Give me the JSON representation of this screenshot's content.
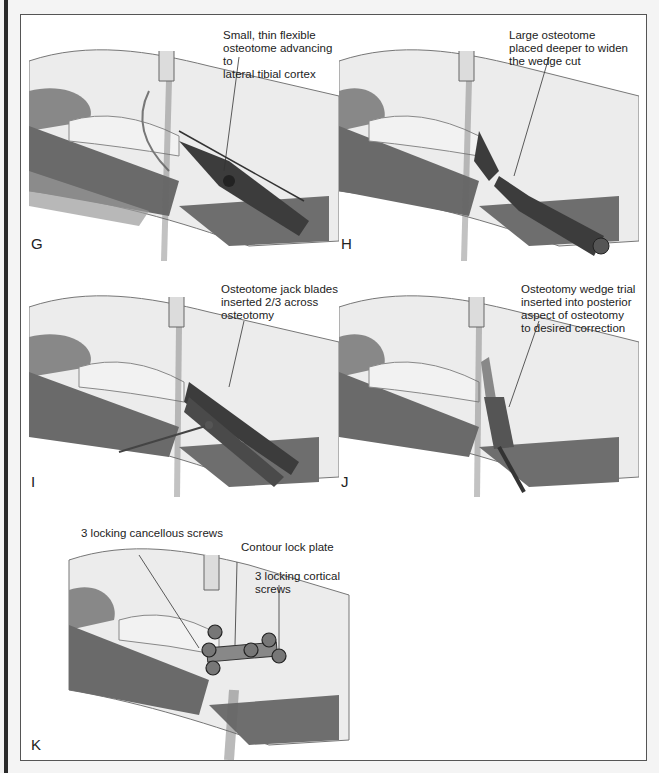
{
  "figure": {
    "panels": [
      {
        "id": "G",
        "letter": "G",
        "callouts": [
          "Small, thin flexible\nosteotome advancing to\nlateral tibial cortex"
        ]
      },
      {
        "id": "H",
        "letter": "H",
        "callouts": [
          "Large osteotome\nplaced deeper to widen\nthe wedge cut"
        ]
      },
      {
        "id": "I",
        "letter": "I",
        "callouts": [
          "Osteotome jack blades\ninserted 2/3 across\nosteotomy"
        ]
      },
      {
        "id": "J",
        "letter": "J",
        "callouts": [
          "Osteotomy wedge trial\ninserted into posterior\naspect of osteotomy\nto desired correction"
        ]
      },
      {
        "id": "K",
        "letter": "K",
        "callouts": [
          "3 locking cancellous screws",
          "Contour lock plate",
          "3 locking cortical screws"
        ]
      }
    ],
    "colors": {
      "muscle_dark": "#6a6a6a",
      "muscle_light": "#9a9a9a",
      "bone": "#ececec",
      "tendon": "#d8d8d8",
      "instrument": "#3c3c3c",
      "outline": "#555555"
    }
  }
}
